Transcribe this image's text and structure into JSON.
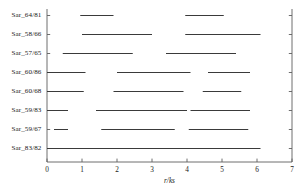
{
  "chart_data": {
    "type": "bar",
    "title": "",
    "xlabel": "r/ks",
    "ylabel": "",
    "xlim": [
      0,
      7
    ],
    "xticks": [
      0,
      1,
      2,
      3,
      4,
      5,
      6,
      7
    ],
    "xticklabels": [
      "0",
      "1",
      "2",
      "3",
      "4",
      "5",
      "6",
      "7"
    ],
    "grid": false,
    "legend": null,
    "orientation": "horizontal",
    "categories": [
      "Sar_64/81",
      "Sar_58/66",
      "Sar_57/65",
      "Sar_60/86",
      "Sar_60/68",
      "Sar_59/83",
      "Sar_59/67",
      "Sar_83/82"
    ],
    "series": [
      {
        "name": "Sar_64/81",
        "intervals": [
          [
            0.95,
            1.9
          ],
          [
            3.95,
            5.05
          ]
        ]
      },
      {
        "name": "Sar_58/66",
        "intervals": [
          [
            1.0,
            3.0
          ],
          [
            3.95,
            6.1
          ]
        ]
      },
      {
        "name": "Sar_57/65",
        "intervals": [
          [
            0.45,
            2.45
          ],
          [
            3.4,
            5.4
          ]
        ]
      },
      {
        "name": "Sar_60/86",
        "intervals": [
          [
            0.0,
            1.1
          ],
          [
            2.0,
            4.1
          ],
          [
            4.6,
            5.8
          ]
        ]
      },
      {
        "name": "Sar_60/68",
        "intervals": [
          [
            0.0,
            1.05
          ],
          [
            1.9,
            3.9
          ],
          [
            4.45,
            5.55
          ]
        ]
      },
      {
        "name": "Sar_59/83",
        "intervals": [
          [
            0.0,
            0.6
          ],
          [
            1.4,
            4.0
          ],
          [
            4.1,
            5.8
          ]
        ]
      },
      {
        "name": "Sar_59/67",
        "intervals": [
          [
            0.2,
            0.6
          ],
          [
            1.55,
            3.65
          ],
          [
            4.05,
            5.75
          ]
        ]
      },
      {
        "name": "Sar_83/82",
        "intervals": [
          [
            0.0,
            6.1
          ]
        ]
      }
    ]
  },
  "axes": {
    "x_axis_label": "r/ks",
    "tick_labels": [
      "0",
      "1",
      "2",
      "3",
      "4",
      "5",
      "6",
      "7"
    ],
    "category_labels": [
      "Sar_64/81",
      "Sar_58/66",
      "Sar_57/65",
      "Sar_60/86",
      "Sar_60/68",
      "Sar_59/83",
      "Sar_59/67",
      "Sar_83/82"
    ]
  },
  "colors": {
    "line": "#3a3a3a",
    "axis": "#5d5d5d",
    "text": "#1a1a1a",
    "background": "#ffffff"
  }
}
